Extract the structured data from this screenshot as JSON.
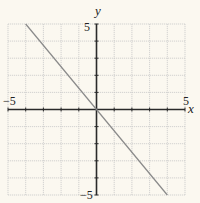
{
  "chart_data": {
    "type": "line",
    "title": "",
    "xlabel": "x",
    "ylabel": "y",
    "xlim": [
      -5,
      5
    ],
    "ylim": [
      -5,
      5
    ],
    "grid": true,
    "grid_step": 1,
    "x_tick_labels": [
      {
        "value": -5,
        "label": "−5"
      },
      {
        "value": 5,
        "label": "5"
      }
    ],
    "y_tick_labels": [
      {
        "value": 5,
        "label": "5"
      },
      {
        "value": -5,
        "label": "−5"
      }
    ],
    "series": [
      {
        "name": "line",
        "equation": "y = -1.25x",
        "x": [
          -4,
          0,
          4
        ],
        "y": [
          5,
          0,
          -5
        ]
      }
    ],
    "colors": {
      "background": "#fbf8f0",
      "grid": "#c8c8c8",
      "axes": "#2a2a2a",
      "line": "#8a8a8a"
    }
  }
}
